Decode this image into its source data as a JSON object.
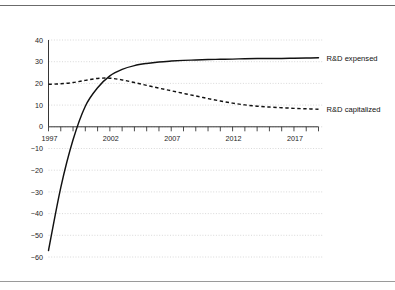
{
  "figure": {
    "title": "",
    "background_color": "#ffffff",
    "top_rule_color": "#6b6b6b",
    "bottom_rule_color": "#9a9a9a"
  },
  "chart_data": {
    "type": "line",
    "title": "",
    "subtitle": "",
    "xlabel": "",
    "ylabel": "",
    "xlim": [
      1997,
      2019
    ],
    "ylim": [
      -60,
      40
    ],
    "grid": true,
    "grid_axis": "y",
    "legend_position": "inline-right",
    "x_tick_labels": [
      "1997",
      "2002",
      "2007",
      "2012",
      "2017"
    ],
    "x_tick_values": [
      1997,
      2002,
      2007,
      2012,
      2017
    ],
    "x_minor_tick_interval": 1,
    "y_tick_labels": [
      "40",
      "30",
      "20",
      "10",
      "0",
      "-10",
      "-20",
      "-30",
      "-40",
      "-50",
      "-60"
    ],
    "y_tick_values": [
      40,
      30,
      20,
      10,
      0,
      -10,
      -20,
      -30,
      -40,
      -50,
      -60
    ],
    "x": [
      1997,
      1998,
      1999,
      2000,
      2001,
      2002,
      2003,
      2004,
      2005,
      2006,
      2007,
      2008,
      2009,
      2010,
      2011,
      2012,
      2013,
      2014,
      2015,
      2016,
      2017,
      2018,
      2019
    ],
    "series": [
      {
        "name": "R&D expensed",
        "style": "solid",
        "color": "#111111",
        "values": [
          -57.0,
          -28.0,
          -6.0,
          9.5,
          18.0,
          23.5,
          26.5,
          28.2,
          29.2,
          29.9,
          30.3,
          30.6,
          30.8,
          31.0,
          31.1,
          31.2,
          31.4,
          31.5,
          31.5,
          31.5,
          31.6,
          31.7,
          31.8
        ]
      },
      {
        "name": "R&D capitalized",
        "style": "dashed",
        "color": "#111111",
        "values": [
          19.6,
          19.8,
          20.4,
          21.4,
          22.3,
          22.4,
          21.6,
          20.4,
          19.1,
          17.8,
          16.6,
          15.4,
          14.2,
          13.0,
          11.9,
          10.9,
          10.1,
          9.5,
          9.1,
          8.8,
          8.5,
          8.3,
          8.1
        ]
      }
    ],
    "annotations": [
      {
        "text": "R&D expensed",
        "x": 2019,
        "y": 31.8
      },
      {
        "text": "R&D capitalized",
        "x": 2019,
        "y": 8.1
      }
    ]
  }
}
